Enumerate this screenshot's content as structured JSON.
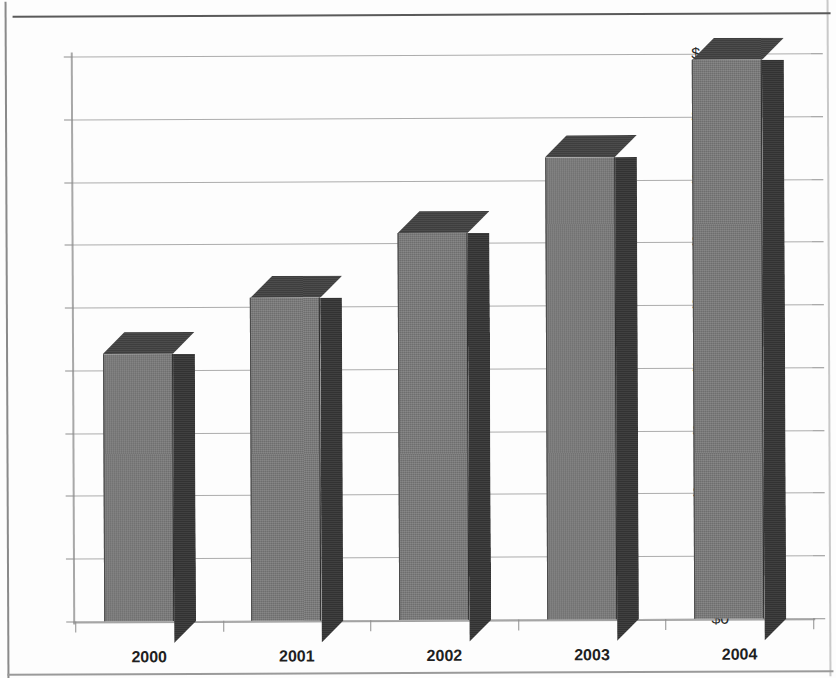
{
  "figure": {
    "title_fragment": "",
    "background_color": "#fdfdfd"
  },
  "colors": {
    "bar_front": "#6e6e6e",
    "bar_side": "#323232",
    "bar_top": "#3e3e3e",
    "gridline": "#adadad",
    "axis": "#a0a0a0",
    "text": "#1f1f1f"
  },
  "chart_data": {
    "type": "bar",
    "title": "",
    "xlabel": "",
    "ylabel": "",
    "categories": [
      "2000",
      "2001",
      "2002",
      "2003",
      "2004"
    ],
    "values": [
      213,
      257,
      308,
      368,
      445
    ],
    "ylim": [
      0,
      450
    ],
    "yticks": [
      0,
      50,
      100,
      150,
      200,
      250,
      300,
      350,
      400,
      450
    ],
    "ytick_labels": [
      "$0",
      "$50",
      "$100",
      "$150",
      "$200",
      "$250",
      "$300",
      "$350",
      "$400",
      "$450"
    ],
    "xtick_labels": [
      "2000",
      "2001",
      "2002",
      "2003",
      "2004"
    ],
    "grid": true,
    "legend": false,
    "style": "3d-column",
    "value_prefix": "$"
  }
}
